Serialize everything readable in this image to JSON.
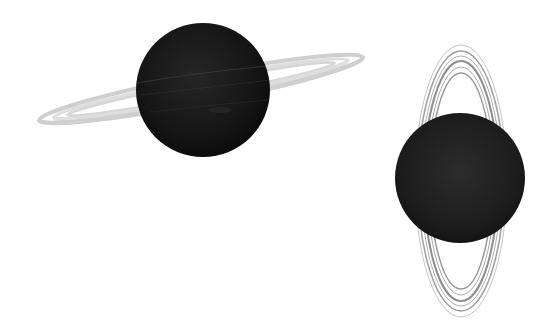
{
  "scene": {
    "width": 558,
    "height": 335,
    "background": "#ffffff",
    "description": "Two dark ringed planets on white background"
  },
  "planets": [
    {
      "name": "tilted-ring-planet",
      "center": [
        203,
        90
      ],
      "radius": 67,
      "color": "#141414",
      "ring": {
        "center": [
          201,
          89
        ],
        "rx": 165,
        "ry": 13,
        "rotation": -11,
        "color": "#c8c8c8"
      }
    },
    {
      "name": "vertical-ring-planet",
      "center": [
        460,
        178
      ],
      "radius": 65,
      "color": "#1a1a1a",
      "ring": {
        "center": [
          461,
          181
        ],
        "rx": 46,
        "ry": 136,
        "rotation": 0,
        "color": "#9a9a9a"
      }
    }
  ]
}
